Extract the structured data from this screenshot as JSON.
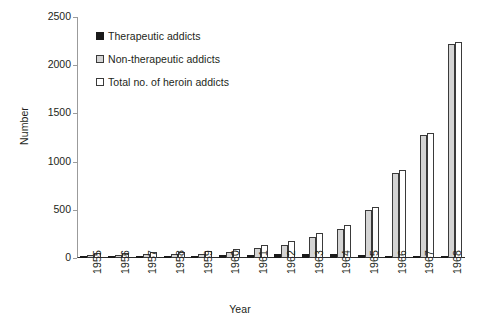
{
  "chart_data": {
    "type": "bar",
    "title": "",
    "xlabel": "Year",
    "ylabel": "Number",
    "ylim": [
      0,
      2500
    ],
    "yticks": [
      0,
      500,
      1000,
      1500,
      2000,
      2500
    ],
    "grid": false,
    "legend_position": "top-left",
    "categories": [
      "1955",
      "1956",
      "1957",
      "1958",
      "1959",
      "1960",
      "1961",
      "1962",
      "1963",
      "1964",
      "1965",
      "1966",
      "1967",
      "1968"
    ],
    "series": [
      {
        "name": "Therapeutic addicts",
        "color": "#1a1a1a",
        "values": [
          18,
          20,
          20,
          22,
          25,
          30,
          35,
          40,
          45,
          40,
          30,
          25,
          20,
          20
        ]
      },
      {
        "name": "Non-therapeutic addicts",
        "color": "#d4d4d4",
        "values": [
          30,
          35,
          40,
          42,
          45,
          60,
          100,
          140,
          215,
          300,
          500,
          885,
          1280,
          2220
        ]
      },
      {
        "name": "Total no. of heroin addicts",
        "color": "#ffffff",
        "values": [
          48,
          55,
          60,
          64,
          70,
          90,
          135,
          180,
          260,
          340,
          530,
          910,
          1300,
          2240
        ]
      }
    ]
  }
}
